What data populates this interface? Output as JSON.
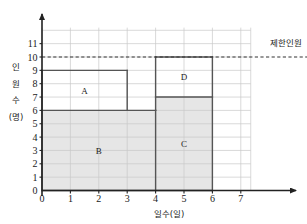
{
  "chart_data": {
    "type": "bar",
    "title": "",
    "xlabel": "일수(일)",
    "ylabel": "인원수(명)",
    "xlim": [
      0,
      7.3
    ],
    "ylim": [
      0,
      11.6
    ],
    "xticks": [
      "0",
      "1",
      "2",
      "3",
      "4",
      "5",
      "6",
      "7"
    ],
    "yticks": [
      "0",
      "1",
      "2",
      "3",
      "4",
      "5",
      "6",
      "7",
      "8",
      "9",
      "10",
      "11"
    ],
    "grid": true,
    "legend": "none",
    "limit_line": {
      "label": "제한인원",
      "value": 10,
      "style": "dashed"
    },
    "regions": [
      {
        "label": "A",
        "x_start": 0,
        "x_end": 3,
        "y_start": 6,
        "y_end": 9,
        "shaded": false
      },
      {
        "label": "B",
        "x_start": 0,
        "x_end": 4,
        "y_start": 0,
        "y_end": 6,
        "shaded": true
      },
      {
        "label": "C",
        "x_start": 4,
        "x_end": 6,
        "y_start": 0,
        "y_end": 7,
        "shaded": true
      },
      {
        "label": "D",
        "x_start": 4,
        "x_end": 6,
        "y_start": 7,
        "y_end": 10,
        "shaded": false
      }
    ],
    "outline_steps": [
      {
        "x_start": 0,
        "x_end": 3,
        "y": 9
      },
      {
        "x_start": 3,
        "x_end": 4,
        "y": 6
      },
      {
        "x_start": 4,
        "x_end": 6,
        "y": 10
      }
    ]
  },
  "colors": {
    "shade": "#e6e6e6",
    "gridline": "#c9c9c9",
    "outline": "#555555",
    "axis": "#222222",
    "text": "#1a1a1a"
  },
  "ylabel_chars": [
    "인",
    "원",
    "수",
    "(명)"
  ]
}
